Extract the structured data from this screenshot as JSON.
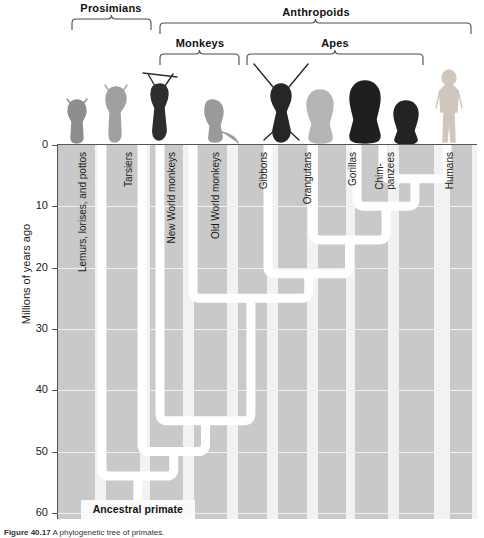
{
  "figure": {
    "caption_label": "Figure 40.17",
    "caption_text": "A phylogenetic tree of primates."
  },
  "axis": {
    "title": "Millions of years ago",
    "ticks": [
      {
        "value": "0",
        "mya": 0
      },
      {
        "value": "10",
        "mya": 10
      },
      {
        "value": "20",
        "mya": 20
      },
      {
        "value": "30",
        "mya": 30
      },
      {
        "value": "40",
        "mya": 40
      },
      {
        "value": "50",
        "mya": 50
      },
      {
        "value": "60",
        "mya": 60
      }
    ]
  },
  "brackets": [
    {
      "label": "Prosimians",
      "x0": 71,
      "x1": 152,
      "y": 18,
      "label_y": 2,
      "label_cx": 111
    },
    {
      "label": "Anthropoids",
      "x0": 159,
      "x1": 472,
      "y": 22,
      "label_y": 6,
      "label_cx": 316
    },
    {
      "label": "Monkeys",
      "x0": 159,
      "x1": 240,
      "y": 53,
      "label_y": 37,
      "label_cx": 200
    },
    {
      "label": "Apes",
      "x0": 246,
      "x1": 424,
      "y": 53,
      "label_y": 37,
      "label_cx": 335
    }
  ],
  "taxa": [
    {
      "name": "Lemurs, lorises, and pottos",
      "label_x": 78,
      "branch_x": 44,
      "lines": [
        "Lemurs, lorises, and pottos"
      ],
      "animal": "lemur"
    },
    {
      "name": "Tarsiers",
      "label_x": 124,
      "branch_x": 84,
      "lines": [
        "Tarsiers"
      ],
      "animal": "tarsier"
    },
    {
      "name": "New World monkeys",
      "label_x": 167,
      "branch_x": 102,
      "lines": [
        "New World monkeys"
      ],
      "animal": "spider-monkey"
    },
    {
      "name": "Old World monkeys",
      "label_x": 211,
      "branch_x": 135,
      "lines": [
        "Old World monkeys"
      ],
      "animal": "macaque"
    },
    {
      "name": "Gibbons",
      "label_x": 259,
      "branch_x": 210,
      "lines": [
        "Gibbons"
      ],
      "animal": "gibbon"
    },
    {
      "name": "Orangutans",
      "label_x": 303,
      "branch_x": 255,
      "lines": [
        "Orangutans"
      ],
      "animal": "orangutan"
    },
    {
      "name": "Gorillas",
      "label_x": 348,
      "branch_x": 299,
      "lines": [
        "Gorillas"
      ],
      "animal": "gorilla"
    },
    {
      "name": "Chimpanzees",
      "label_x": 375,
      "branch_x": 325,
      "lines": [
        "Chim-",
        "panzees"
      ],
      "animal": "chimpanzee"
    },
    {
      "name": "Humans",
      "label_x": 445,
      "branch_x": 389,
      "lines": [
        "Humans"
      ],
      "animal": "human"
    }
  ],
  "nodes": [
    {
      "name": "root-ancestral-primate",
      "mya": 54.0
    },
    {
      "name": "tarsier-anthropoid-split",
      "mya": 50.0
    },
    {
      "name": "new-world-old-world-split",
      "mya": 45.0
    },
    {
      "name": "old-world-monkey-ape-split",
      "mya": 25.0
    },
    {
      "name": "gibbon-greatape-split",
      "mya": 21.0
    },
    {
      "name": "orangutan-african-ape-split",
      "mya": 15.5
    },
    {
      "name": "gorilla-chimp-human-split",
      "mya": 10.0
    },
    {
      "name": "chimp-human-split",
      "mya": 5.5
    }
  ],
  "ancestral": {
    "label": "Ancestral primate",
    "stem_mya": 58.0
  },
  "colors": {
    "plot_background": "#c9c9c9",
    "band_light": "#f2f2f2",
    "tree_line": "#ffffff",
    "axis": "#555555",
    "text": "#1a1a1a"
  },
  "chart_data": {
    "type": "tree",
    "ylabel": "Millions of years ago",
    "ylim": [
      0,
      62
    ],
    "y_inverted": true,
    "grid": true,
    "tips": [
      "Lemurs, lorises, and pottos",
      "Tarsiers",
      "New World monkeys",
      "Old World monkeys",
      "Gibbons",
      "Orangutans",
      "Gorillas",
      "Chimpanzees",
      "Humans"
    ],
    "divergences_mya": [
      {
        "clade": "Ancestral primate / Lemurs, lorises, and pottos",
        "mya": 54
      },
      {
        "clade": "Tarsiers / Anthropoids",
        "mya": 50
      },
      {
        "clade": "New World monkeys / (Old World monkeys + Apes)",
        "mya": 45
      },
      {
        "clade": "Old World monkeys / Apes",
        "mya": 25
      },
      {
        "clade": "Gibbons / Great apes",
        "mya": 21
      },
      {
        "clade": "Orangutans / African apes + Humans",
        "mya": 15.5
      },
      {
        "clade": "Gorillas / (Chimpanzees + Humans)",
        "mya": 10
      },
      {
        "clade": "Chimpanzees / Humans",
        "mya": 5.5
      }
    ],
    "groups": [
      {
        "label": "Prosimians",
        "members": [
          "Lemurs, lorises, and pottos",
          "Tarsiers"
        ]
      },
      {
        "label": "Anthropoids",
        "members": [
          "New World monkeys",
          "Old World monkeys",
          "Gibbons",
          "Orangutans",
          "Gorillas",
          "Chimpanzees",
          "Humans"
        ]
      },
      {
        "label": "Monkeys",
        "members": [
          "New World monkeys",
          "Old World monkeys"
        ]
      },
      {
        "label": "Apes",
        "members": [
          "Gibbons",
          "Orangutans",
          "Gorillas",
          "Chimpanzees"
        ]
      }
    ],
    "legend_position": "none"
  }
}
